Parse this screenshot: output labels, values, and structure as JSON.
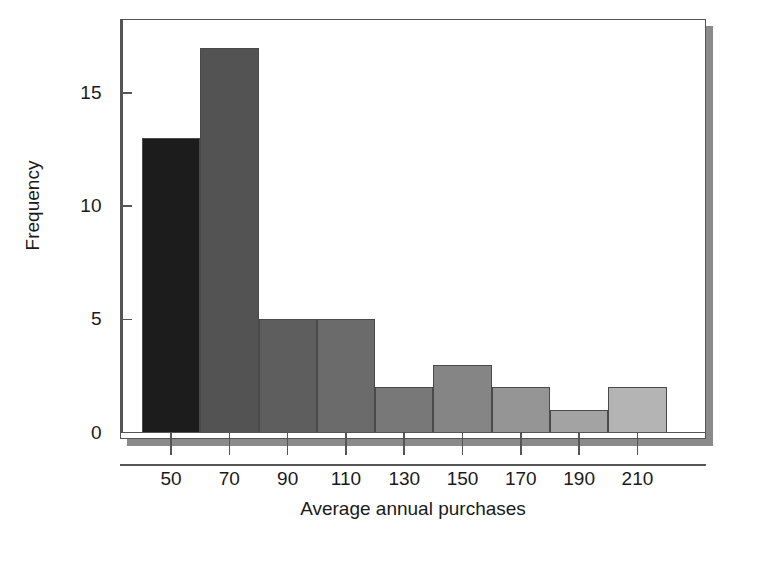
{
  "chart_data": {
    "type": "bar",
    "title": "",
    "subtitle": "",
    "xlabel": "Average annual purchases",
    "ylabel": "Frequency",
    "categories": [
      "50",
      "70",
      "90",
      "110",
      "130",
      "150",
      "170",
      "190",
      "210"
    ],
    "values": [
      13,
      17,
      5,
      5,
      2,
      3,
      2,
      1,
      2
    ],
    "bin_width": 20,
    "bin_edges": [
      40,
      60,
      80,
      100,
      120,
      140,
      160,
      180,
      200,
      220
    ],
    "x_tick_labels": [
      "50",
      "70",
      "90",
      "110",
      "130",
      "150",
      "170",
      "190",
      "210"
    ],
    "y_tick_labels": [
      "0",
      "5",
      "10",
      "15"
    ],
    "y_tick_values": [
      0,
      5,
      10,
      15
    ],
    "ylim": [
      0,
      18.2
    ],
    "xlim": [
      33,
      233
    ],
    "grid": false,
    "legend": false,
    "legend_position": "none",
    "bar_colors": [
      "#1c1c1c",
      "#535353",
      "#5e5e5e",
      "#6b6b6b",
      "#787878",
      "#858585",
      "#959595",
      "#a3a3a3",
      "#b4b4b4"
    ],
    "bar_edge_color": "#4a4a4a",
    "axis_color": "#555555",
    "shadow_color": "#8a8a8a",
    "background_color": "#ffffff"
  }
}
